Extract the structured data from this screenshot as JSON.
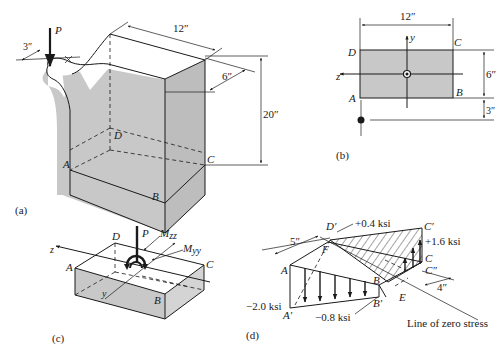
{
  "figure": {
    "panels": [
      {
        "id": "a",
        "caption": "(a)",
        "load_label": "P",
        "dimensions": {
          "eccentricity": "3″",
          "width": "12″",
          "depth": "6″",
          "height": "20″"
        },
        "points": {
          "A": "A",
          "B": "B",
          "C": "C",
          "D": "D"
        }
      },
      {
        "id": "b",
        "caption": "(b)",
        "axis_y": "y",
        "axis_z": "z",
        "dimensions": {
          "width": "12″",
          "depth": "6″",
          "offset": "3″"
        },
        "points": {
          "A": "A",
          "B": "B",
          "C": "C",
          "D": "D"
        }
      },
      {
        "id": "c",
        "caption": "(c)",
        "load_label": "P",
        "moment_z": "M",
        "moment_z_sub": "zz",
        "moment_y": "M",
        "moment_y_sub": "yy",
        "axis_z": "z",
        "axis_y": "y",
        "points": {
          "A": "A",
          "B": "B",
          "C": "C",
          "D": "D"
        }
      },
      {
        "id": "d",
        "caption": "(d)",
        "stresses": {
          "D_prime": "+0.4 ksi",
          "C_prime": "+1.6 ksi",
          "A_prime": "−2.0 ksi",
          "B_prime": "−0.8 ksi"
        },
        "dimensions": {
          "left": "5″",
          "right": "4″"
        },
        "points": {
          "A": "A",
          "A_prime": "A′",
          "B": "B",
          "B_prime": "B′",
          "C": "C",
          "C_prime": "C′",
          "C_dprime": "C″",
          "D_prime": "D′",
          "E": "E",
          "F": "F"
        },
        "zero_line_label": "Line of zero stress"
      }
    ]
  }
}
